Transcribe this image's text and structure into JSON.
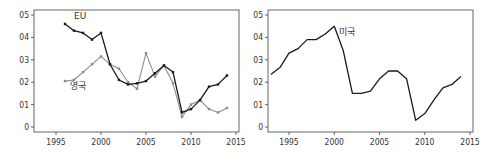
{
  "chart_data": [
    {
      "type": "line",
      "title": "",
      "xlabel": "",
      "ylabel": "",
      "xlim": [
        1993,
        2015
      ],
      "ylim": [
        0,
        0.5
      ],
      "x_ticks": [
        1995,
        2000,
        2005,
        2010,
        2015
      ],
      "y_ticks": [
        0,
        0.1,
        0.2,
        0.3,
        0.4,
        0.5
      ],
      "y_tick_labels": [
        "0",
        "01",
        "02",
        "03",
        "04",
        "05"
      ],
      "x_tick_labels": [
        "1995",
        "2000",
        "2005",
        "2010",
        "2015"
      ],
      "grid": false,
      "legend": "inline labels",
      "series": [
        {
          "name": "EU",
          "color": "#1a1a1a",
          "markers": true,
          "x": [
            1996,
            1997,
            1998,
            1999,
            2000,
            2001,
            2002,
            2003,
            2004,
            2005,
            2006,
            2007,
            2008,
            2009,
            2010,
            2011,
            2012,
            2013,
            2014
          ],
          "values": [
            0.46,
            0.43,
            0.42,
            0.39,
            0.42,
            0.28,
            0.21,
            0.19,
            0.195,
            0.205,
            0.24,
            0.275,
            0.245,
            0.065,
            0.08,
            0.12,
            0.18,
            0.19,
            0.23
          ]
        },
        {
          "name": "영국",
          "color": "#8c8c8c",
          "markers": true,
          "x": [
            1996,
            1997,
            1998,
            1999,
            2000,
            2001,
            2002,
            2003,
            2004,
            2005,
            2006,
            2007,
            2008,
            2009,
            2010,
            2011,
            2012,
            2013,
            2014
          ],
          "values": [
            0.205,
            0.21,
            0.245,
            0.28,
            0.315,
            0.28,
            0.26,
            0.2,
            0.17,
            0.33,
            0.225,
            0.275,
            0.195,
            0.045,
            0.1,
            0.12,
            0.08,
            0.065,
            0.085
          ]
        }
      ],
      "annotations": [
        {
          "text": "EU",
          "x": 1997,
          "y": 0.48
        },
        {
          "text": "영국",
          "x": 1996.5,
          "y": 0.17
        }
      ]
    },
    {
      "type": "line",
      "title": "",
      "xlabel": "",
      "ylabel": "",
      "xlim": [
        1992.3,
        2015.2
      ],
      "ylim": [
        0,
        0.5
      ],
      "x_ticks": [
        1995,
        2000,
        2005,
        2010,
        2015
      ],
      "y_ticks": [
        0,
        0.1,
        0.2,
        0.3,
        0.4,
        0.5
      ],
      "y_tick_labels": [
        "0",
        "01",
        "02",
        "03",
        "04",
        "05"
      ],
      "x_tick_labels": [
        "1995",
        "2000",
        "2005",
        "2010",
        "2015"
      ],
      "grid": false,
      "legend": "inline labels",
      "series": [
        {
          "name": "미국",
          "color": "#1a1a1a",
          "markers": false,
          "x": [
            1993,
            1994,
            1995,
            1996,
            1997,
            1998,
            1999,
            2000,
            2001,
            2002,
            2003,
            2004,
            2005,
            2006,
            2007,
            2008,
            2009,
            2010,
            2011,
            2012,
            2013,
            2014
          ],
          "values": [
            0.235,
            0.265,
            0.33,
            0.35,
            0.39,
            0.39,
            0.415,
            0.45,
            0.34,
            0.15,
            0.15,
            0.16,
            0.215,
            0.25,
            0.25,
            0.215,
            0.03,
            0.06,
            0.12,
            0.175,
            0.19,
            0.225
          ]
        }
      ],
      "annotations": [
        {
          "text": "미국",
          "x": 2000.5,
          "y": 0.41
        }
      ]
    }
  ]
}
